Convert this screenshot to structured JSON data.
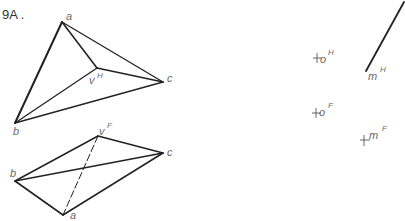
{
  "title": "9A .",
  "colors": {
    "line": "#222222",
    "label": "#6a6a6a",
    "background": "#ffffff"
  },
  "top_view": {
    "name": "Horizontal (H) view",
    "points": {
      "a": {
        "label": "a",
        "x": 62,
        "y": 22
      },
      "b": {
        "label": "b",
        "x": 15,
        "y": 123
      },
      "c": {
        "label": "c",
        "x": 163,
        "y": 82
      },
      "v": {
        "label": "v",
        "sup": "H",
        "x": 97,
        "y": 68
      }
    },
    "edges": [
      [
        "a",
        "b"
      ],
      [
        "a",
        "c"
      ],
      [
        "b",
        "c"
      ],
      [
        "a",
        "v"
      ],
      [
        "b",
        "v"
      ],
      [
        "c",
        "v"
      ]
    ]
  },
  "front_view": {
    "name": "Frontal (F) view",
    "points": {
      "a": {
        "label": "a",
        "x": 63,
        "y": 215
      },
      "b": {
        "label": "b",
        "x": 15,
        "y": 181
      },
      "c": {
        "label": "c",
        "x": 163,
        "y": 153
      },
      "v": {
        "label": "v",
        "sup": "F",
        "x": 98,
        "y": 136
      }
    },
    "edges": [
      [
        "b",
        "v"
      ],
      [
        "v",
        "c"
      ],
      [
        "c",
        "a"
      ],
      [
        "a",
        "b"
      ],
      [
        "b",
        "c"
      ]
    ],
    "hidden_edges": [
      [
        "v",
        "a"
      ]
    ]
  },
  "right_elements": {
    "o_H": {
      "label": "o",
      "sup": "H",
      "x": 318,
      "y": 58
    },
    "m_H": {
      "label": "m",
      "sup": "H",
      "x": 366,
      "y": 71,
      "line_end_x": 405,
      "line_end_y": 0
    },
    "o_F": {
      "label": "o",
      "sup": "F",
      "x": 317,
      "y": 114
    },
    "m_F": {
      "label": "m",
      "sup": "F",
      "x": 366,
      "y": 138
    }
  }
}
